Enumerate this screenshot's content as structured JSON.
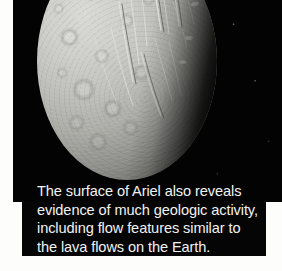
{
  "figure": {
    "subject": "Ariel",
    "photo": {
      "alt_name": "ariel-surface-photograph",
      "body_label": "Ariel",
      "background_color": "#030303",
      "surface_light_color": "#d9d9d6",
      "surface_shadow_color": "#232322",
      "terminator_note": "day-night terminator on right limb"
    },
    "caption": {
      "background_color": "#050505",
      "text_color": "#f2f2f2",
      "full_text": "The surface of Ariel also reveals evidence of much geologic activity, including flow features similar to the lava flows on the Earth.",
      "lines": [
        "The surface of Ariel also reveals",
        "evidence of much geologic activity,",
        "including flow features similar to",
        "the lava flows on the Earth."
      ],
      "lines_after_first": "evidence of much geologic activity,\ninclude_placeholder"
    }
  },
  "page": {
    "background_color": "#ffffff"
  }
}
